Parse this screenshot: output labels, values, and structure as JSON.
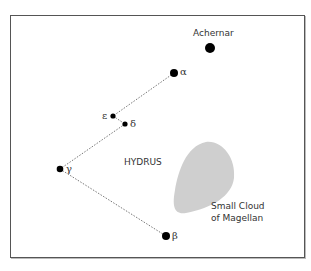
{
  "diagram": {
    "constellation_label": "HYDRUS",
    "nebula_label_line1": "Small Cloud",
    "nebula_label_line2": "of Magellan",
    "stars": [
      {
        "name": "Achernar",
        "label": "Achernar",
        "x": 210,
        "y": 48,
        "size": "large"
      },
      {
        "name": "alpha",
        "label": "α",
        "x": 174,
        "y": 73,
        "size": "medium"
      },
      {
        "name": "epsilon",
        "label": "ε",
        "x": 113,
        "y": 116,
        "size": "small"
      },
      {
        "name": "delta",
        "label": "δ",
        "x": 125,
        "y": 124,
        "size": "small"
      },
      {
        "name": "gamma",
        "label": "γ",
        "x": 60,
        "y": 169,
        "size": "medium"
      },
      {
        "name": "beta",
        "label": "β",
        "x": 166,
        "y": 236,
        "size": "medium"
      }
    ],
    "lines": [
      [
        "alpha",
        "epsilon"
      ],
      [
        "epsilon",
        "delta"
      ],
      [
        "delta",
        "gamma"
      ],
      [
        "gamma",
        "beta"
      ]
    ],
    "colors": {
      "star": "#000000",
      "line": "#666666",
      "cloud": "#cfcfcf",
      "frame": "#555555"
    }
  }
}
